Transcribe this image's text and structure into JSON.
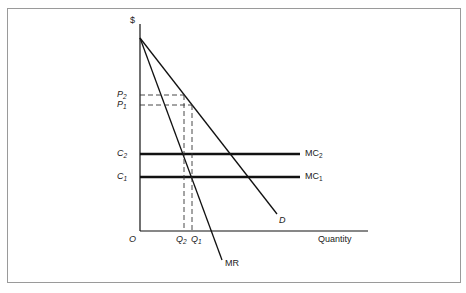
{
  "figure": {
    "type": "monopoly price discrimination / marginal cost diagram",
    "labels": {
      "y_axis": "$",
      "x_axis": "Quantity",
      "origin": "O",
      "p2": {
        "base": "P",
        "sub": "2"
      },
      "p1": {
        "base": "P",
        "sub": "1"
      },
      "c2": {
        "base": "C",
        "sub": "2"
      },
      "c1": {
        "base": "C",
        "sub": "1"
      },
      "q2": {
        "base": "Q",
        "sub": "2"
      },
      "q1": {
        "base": "Q",
        "sub": "1"
      },
      "mc2": {
        "base": "MC",
        "sub": "2"
      },
      "mc1": {
        "base": "MC",
        "sub": "1"
      },
      "demand": "D",
      "marginal_revenue": "MR"
    },
    "curves": [
      {
        "name": "D",
        "style": "solid",
        "from": [
          140,
          38
        ],
        "to": [
          277,
          214
        ]
      },
      {
        "name": "MR",
        "style": "solid",
        "from": [
          140,
          38
        ],
        "to": [
          222,
          260
        ]
      },
      {
        "name": "MC2",
        "style": "bold",
        "from": [
          140,
          154
        ],
        "to": [
          300,
          154
        ]
      },
      {
        "name": "MC1",
        "style": "bold",
        "from": [
          140,
          177
        ],
        "to": [
          300,
          177
        ]
      }
    ],
    "guides": [
      {
        "name": "P2",
        "style": "dashed",
        "from": [
          140,
          95
        ],
        "to": [
          184,
          95
        ]
      },
      {
        "name": "P1",
        "style": "dashed",
        "from": [
          140,
          105
        ],
        "to": [
          192,
          105
        ]
      },
      {
        "name": "Q2",
        "style": "dashed",
        "from": [
          184,
          95
        ],
        "to": [
          184,
          231
        ]
      },
      {
        "name": "Q1",
        "style": "dashed",
        "from": [
          192,
          105
        ],
        "to": [
          192,
          231
        ]
      }
    ]
  }
}
